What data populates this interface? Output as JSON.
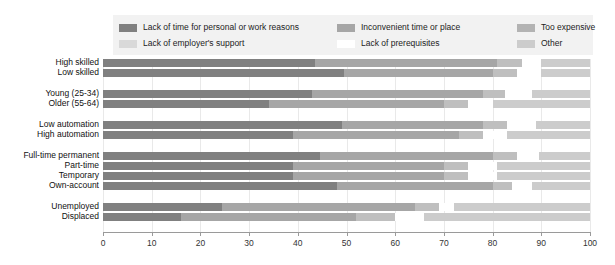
{
  "chart_data": {
    "type": "bar",
    "orientation": "horizontal",
    "stacked": true,
    "title": "",
    "subtitle": "",
    "xlabel": "",
    "ylabel": "",
    "xlim": [
      0,
      100
    ],
    "xticks": [
      0,
      10,
      20,
      30,
      40,
      50,
      60,
      70,
      80,
      90,
      100
    ],
    "xtick_labels": [
      "0",
      "10",
      "20",
      "30",
      "40",
      "50",
      "60",
      "70",
      "80",
      "90",
      "100"
    ],
    "grid": true,
    "grid_axis": "x",
    "legend_position": "top",
    "categories": [
      "High skilled",
      "Low skilled",
      "Young (25-34)",
      "Older (55-64)",
      "Low automation",
      "High automation",
      "Full-time permanent",
      "Part-time",
      "Temporary",
      "Own-account",
      "Unemployed",
      "Displaced"
    ],
    "series": [
      {
        "name": "Lack of time for personal or work reasons",
        "color": "#808080",
        "values": [
          43.5,
          49.5,
          43.0,
          34.0,
          49.0,
          39.0,
          44.5,
          39.0,
          39.0,
          48.0,
          24.5,
          16.0
        ]
      },
      {
        "name": "Lack of employer's support",
        "color": "#d9d9d9",
        "values": [
          0.0,
          0.0,
          0.0,
          0.0,
          0.0,
          0.0,
          0.0,
          0.0,
          0.0,
          0.0,
          0.0,
          0.0
        ]
      },
      {
        "name": "Inconvenient time or place",
        "color": "#a6a6a6",
        "values": [
          37.5,
          30.5,
          35.0,
          36.0,
          29.0,
          34.0,
          35.5,
          31.0,
          31.0,
          32.0,
          39.5,
          36.0
        ]
      },
      {
        "name": "Lack of prerequisites",
        "color": "#ffffff",
        "values": [
          4.0,
          5.0,
          5.5,
          5.0,
          6.0,
          5.0,
          4.5,
          6.0,
          6.0,
          4.0,
          3.0,
          6.0
        ]
      },
      {
        "name": "Too expensive",
        "color": "#bfbfbf",
        "values": [
          5.0,
          5.0,
          4.5,
          5.0,
          5.0,
          5.0,
          5.0,
          5.0,
          5.0,
          4.0,
          5.0,
          8.0
        ]
      },
      {
        "name": "Other",
        "color": "#cccccc",
        "values": [
          10.0,
          10.0,
          12.0,
          20.0,
          11.0,
          17.0,
          10.5,
          19.0,
          19.0,
          12.0,
          28.0,
          34.0
        ]
      }
    ],
    "stack_order": [
      "Lack of time for personal or work reasons",
      "Inconvenient time or place",
      "Too expensive",
      "Lack of prerequisites",
      "Other"
    ],
    "group_gaps_after": [
      "Low skilled",
      "Older (55-64)",
      "High automation",
      "Own-account"
    ]
  },
  "legend": {
    "items": [
      {
        "label": "Lack of time for personal or work reasons",
        "color": "#808080",
        "column": 0,
        "row": 0
      },
      {
        "label": "Lack of employer's support",
        "color": "#d9d9d9",
        "column": 0,
        "row": 1
      },
      {
        "label": "Inconvenient time or place",
        "color": "#a6a6a6",
        "column": 1,
        "row": 0
      },
      {
        "label": "Lack of prerequisites",
        "color": "#ffffff",
        "column": 1,
        "row": 1
      },
      {
        "label": "Too expensive",
        "color": "#b3b3b3",
        "column": 2,
        "row": 0
      },
      {
        "label": "Other",
        "color": "#cccccc",
        "column": 2,
        "row": 1
      }
    ],
    "background_color": "#f2f2f2"
  },
  "colors": {
    "background": "#ffffff",
    "gridline": "#e9e9e9",
    "axis": "#9a9a9a",
    "text": "#111111"
  }
}
